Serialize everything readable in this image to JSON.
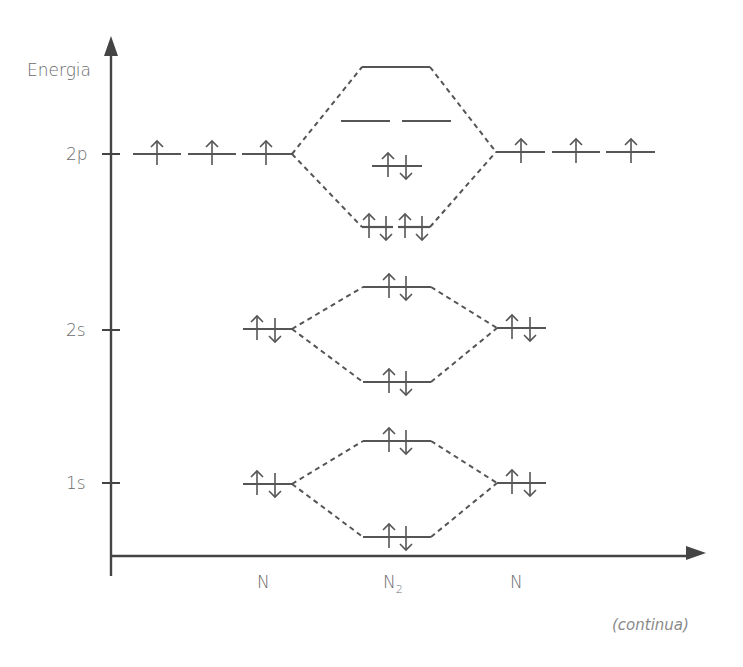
{
  "diagram": {
    "type": "molecular-orbital-energy-diagram",
    "molecule": "N2",
    "y_axis_label": "Energia",
    "x_labels": {
      "left_atom": "N",
      "molecule_main": "N",
      "molecule_sub": "2",
      "right_atom": "N"
    },
    "energy_ticks": [
      "2p",
      "2s",
      "1s"
    ],
    "footer_note": "(continua)",
    "colors": {
      "line": "#555555",
      "text": "#6a6a6a",
      "dashed": "#555555"
    },
    "atomic_orbitals": {
      "left": [
        {
          "level": "1s",
          "electrons": "↑↓"
        },
        {
          "level": "2s",
          "electrons": "↑↓"
        },
        {
          "level": "2p",
          "electrons": [
            "↑",
            "↑",
            "↑"
          ]
        }
      ],
      "right": [
        {
          "level": "1s",
          "electrons": "↑↓"
        },
        {
          "level": "2s",
          "electrons": "↑↓"
        },
        {
          "level": "2p",
          "electrons": [
            "↑",
            "↑",
            "↑"
          ]
        }
      ]
    },
    "molecular_orbitals": [
      {
        "name": "sigma-1s",
        "electrons": "↑↓"
      },
      {
        "name": "sigma-star-1s",
        "electrons": "↑↓"
      },
      {
        "name": "sigma-2s",
        "electrons": "↑↓"
      },
      {
        "name": "sigma-star-2s",
        "electrons": "↑↓"
      },
      {
        "name": "pi-2p",
        "electrons": [
          "↑↓",
          "↑↓"
        ]
      },
      {
        "name": "sigma-2p",
        "electrons": "↑↓"
      },
      {
        "name": "pi-star-2p",
        "electrons": [
          "",
          ""
        ]
      },
      {
        "name": "sigma-star-2p",
        "electrons": ""
      }
    ]
  }
}
